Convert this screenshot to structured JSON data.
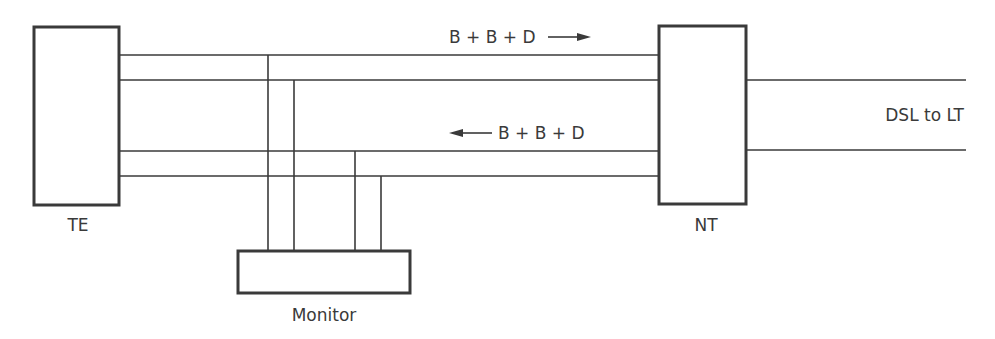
{
  "diagram": {
    "colors": {
      "stroke": "#3a3a3a",
      "background": "#ffffff",
      "text": "#3a3a3a"
    },
    "blocks": {
      "te": {
        "label": "TE"
      },
      "nt": {
        "label": "NT"
      },
      "monitor": {
        "label": "Monitor"
      }
    },
    "signals": {
      "upstream": {
        "label": "B + B + D",
        "direction": "right"
      },
      "downstream": {
        "label": "B + B + D",
        "direction": "left"
      }
    },
    "line_label": "DSL to LT"
  }
}
